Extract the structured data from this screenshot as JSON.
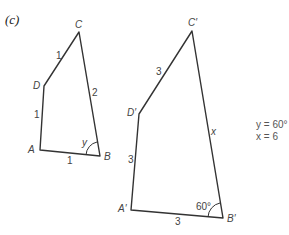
{
  "part_label": "(c)",
  "small_quad": {
    "vertices": {
      "A": "A",
      "B": "B",
      "C": "C",
      "D": "D"
    },
    "sides": {
      "AB": "1",
      "AD": "1",
      "DC": "1",
      "CB": "2"
    },
    "angle_B": "y"
  },
  "large_quad": {
    "vertices": {
      "A": "A′",
      "B": "B′",
      "C": "C′",
      "D": "D′"
    },
    "sides": {
      "AB": "3",
      "AD": "3",
      "DC": "3",
      "CB": "x"
    },
    "angle_B": "60°"
  },
  "answers": [
    "y = 60°",
    "x = 6"
  ]
}
